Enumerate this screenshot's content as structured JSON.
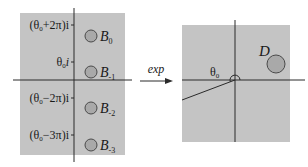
{
  "colors": {
    "panel": "#c4c4c4",
    "axis": "#2a2a2a",
    "disk_fill": "#a9a9a9",
    "disk_stroke": "#4a4a4a",
    "text": "#1a1a1a"
  },
  "left_panel": {
    "tick_labels": [
      {
        "base": "(θ",
        "sub": "0",
        "rest": "+2π)i"
      },
      {
        "base": "θ",
        "sub": "0",
        "rest": "i"
      },
      {
        "base": "(θ",
        "sub": "0",
        "rest": "−2π)i"
      },
      {
        "base": "(θ",
        "sub": "0",
        "rest": "−3π)i"
      }
    ],
    "disks": [
      {
        "letter": "B",
        "sub": "0"
      },
      {
        "letter": "B",
        "sub": "-1"
      },
      {
        "letter": "B",
        "sub": "-2"
      },
      {
        "letter": "B",
        "sub": "-3"
      }
    ]
  },
  "map": {
    "label": "exp"
  },
  "right_panel": {
    "angle_label": {
      "base": "θ",
      "sub": "0"
    },
    "disk_label": "D"
  }
}
